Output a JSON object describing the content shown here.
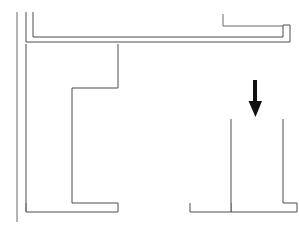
{
  "figure": {
    "background_color": "#ffffff",
    "line_color": "#4d4d4d",
    "thin_line_color": "#6b6b6b",
    "arrow_color": "#111111",
    "width": 299,
    "height": 230
  },
  "elements": {
    "left_edge_line": {
      "name": "left boundary line",
      "points": "17,12 17,222"
    },
    "upper_wall_profile": {
      "name": "upper horizontal wall with return",
      "points": "26,12 26,42 290,42 290,25 283,25 283,37 33,37 33,12"
    },
    "top_right_return_line": {
      "name": "top right return tail",
      "points": "223,14 223,26 283,26"
    },
    "left_vertical_wall": {
      "name": "left vertical wall with step and base footing",
      "points": "26,44 26,212 118,212 118,203 72,203 72,88 118,88 118,44"
    },
    "left_inner_step_line": {
      "name": "left inner step return",
      "points": "26,203 26,212"
    },
    "right_column": {
      "name": "right column with base footing",
      "points": "231,119 231,212 297,212 297,203 283,203 283,119"
    },
    "right_footing": {
      "name": "right column footing slab",
      "points": "190,203 190,212 231,212 231,203"
    },
    "load_arrow": {
      "name": "downward load arrow",
      "shaft": "255,80 255,104",
      "head": "250,102 261,102 255.5,116",
      "direction": "down",
      "tip_x": 255,
      "tip_y": 116
    }
  },
  "labels": {
    "arrow_label": "",
    "dimension_label": "",
    "caption": ""
  }
}
